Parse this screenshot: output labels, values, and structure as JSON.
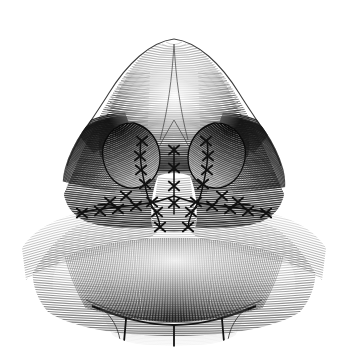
{
  "figure": {
    "subtitle": "Surgical engraving illustration",
    "style": "line-engraving hatching",
    "background_color": "#ffffff",
    "ink_color": "#111111",
    "midtone_color": "#4a4a4a",
    "light_color": "#8c8c8c",
    "canvas": {
      "width": 348,
      "height": 347
    },
    "caption": "Worm's-eye (basal) view of the nasal tip, nostrils, columella and upper lip, drawn in engraved hatching, showing cross-stitch suture lines along the alar creases, columella and nostril sills."
  },
  "anatomy": {
    "parts": [
      {
        "id": "nasal-tip",
        "label": "Nasal tip / dorsum dome",
        "cx": 174,
        "cy": 110
      },
      {
        "id": "left-ala",
        "label": "Left ala",
        "cx": 96,
        "cy": 170
      },
      {
        "id": "right-ala",
        "label": "Right ala",
        "cx": 252,
        "cy": 170
      },
      {
        "id": "left-nostril",
        "label": "Left nostril (naris)",
        "cx": 131,
        "cy": 152
      },
      {
        "id": "right-nostril",
        "label": "Right nostril (naris)",
        "cx": 217,
        "cy": 152
      },
      {
        "id": "columella",
        "label": "Columella",
        "cx": 174,
        "cy": 196
      },
      {
        "id": "upper-lip",
        "label": "Upper lip",
        "cx": 174,
        "cy": 272
      },
      {
        "id": "vermillion-border",
        "label": "Vermillion border",
        "cx": 174,
        "cy": 312
      }
    ]
  },
  "sutures": {
    "count_visible": 34,
    "mark_shape": "cross-stitch-x",
    "lines": [
      {
        "id": "columella-midline",
        "label": "Columella midline suture",
        "marks": 4
      },
      {
        "id": "left-alar-crease",
        "label": "Left alar crease suture line",
        "marks": 7
      },
      {
        "id": "right-alar-crease",
        "label": "Right alar crease suture line",
        "marks": 7
      },
      {
        "id": "left-nostril-rim",
        "label": "Left nostril rim suture line",
        "marks": 5
      },
      {
        "id": "right-nostril-rim",
        "label": "Right nostril rim suture line",
        "marks": 5
      },
      {
        "id": "left-columella-base",
        "label": "Left columella base suture",
        "marks": 3
      },
      {
        "id": "right-columella-base",
        "label": "Right columella base suture",
        "marks": 3
      }
    ]
  },
  "chart_data": {
    "type": "line",
    "xlabel": "",
    "ylabel": "",
    "note": "Non-quantitative figure: engraved anatomical illustration rendered as hatching strokes."
  }
}
